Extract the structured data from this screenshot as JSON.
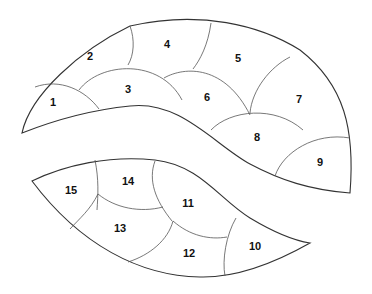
{
  "diagram": {
    "upper_shape": {
      "regions": [
        {
          "id": 1,
          "label": "1",
          "x": 53,
          "y": 102
        },
        {
          "id": 2,
          "label": "2",
          "x": 90,
          "y": 56
        },
        {
          "id": 3,
          "label": "3",
          "x": 128,
          "y": 89
        },
        {
          "id": 4,
          "label": "4",
          "x": 167,
          "y": 44
        },
        {
          "id": 5,
          "label": "5",
          "x": 238,
          "y": 58
        },
        {
          "id": 6,
          "label": "6",
          "x": 207,
          "y": 97
        },
        {
          "id": 7,
          "label": "7",
          "x": 299,
          "y": 99
        },
        {
          "id": 8,
          "label": "8",
          "x": 257,
          "y": 137
        },
        {
          "id": 9,
          "label": "9",
          "x": 320,
          "y": 162
        }
      ]
    },
    "lower_shape": {
      "regions": [
        {
          "id": 10,
          "label": "10",
          "x": 255,
          "y": 246
        },
        {
          "id": 11,
          "label": "11",
          "x": 188,
          "y": 203
        },
        {
          "id": 12,
          "label": "12",
          "x": 189,
          "y": 253
        },
        {
          "id": 13,
          "label": "13",
          "x": 120,
          "y": 228
        },
        {
          "id": 14,
          "label": "14",
          "x": 128,
          "y": 181
        },
        {
          "id": 15,
          "label": "15",
          "x": 71,
          "y": 190
        }
      ]
    }
  }
}
